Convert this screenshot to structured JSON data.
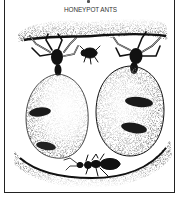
{
  "caption": "HONEYPOT ANTS",
  "illustration": {
    "subject": "honeypot ants",
    "style": "black-and-white stipple drawing",
    "elements": [
      "ceiling-soil",
      "replete-ant-left",
      "replete-ant-right",
      "small-ant-top",
      "worker-ant",
      "floor-soil"
    ]
  },
  "colors": {
    "ink": "#111111",
    "paper": "#ffffff",
    "border": "#222222"
  }
}
